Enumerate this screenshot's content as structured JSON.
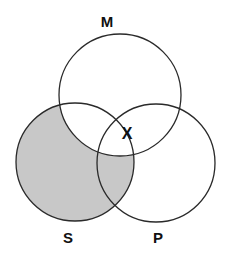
{
  "diagram": {
    "type": "venn-3",
    "colors": {
      "background": "#ffffff",
      "stroke": "#2a2a2a",
      "shade": "#c8c8c8"
    },
    "circles": [
      {
        "id": "M",
        "label": "M",
        "cx": 120,
        "cy": 95,
        "r": 61
      },
      {
        "id": "S",
        "label": "S",
        "cx": 75,
        "cy": 162,
        "r": 59
      },
      {
        "id": "P",
        "label": "P",
        "cx": 156,
        "cy": 163,
        "r": 59
      }
    ],
    "labels": {
      "M": "M",
      "S": "S",
      "P": "P"
    },
    "shaded_region": "S outside M",
    "mark": {
      "text": "X",
      "region": "M ∩ P (on S boundary)"
    }
  }
}
